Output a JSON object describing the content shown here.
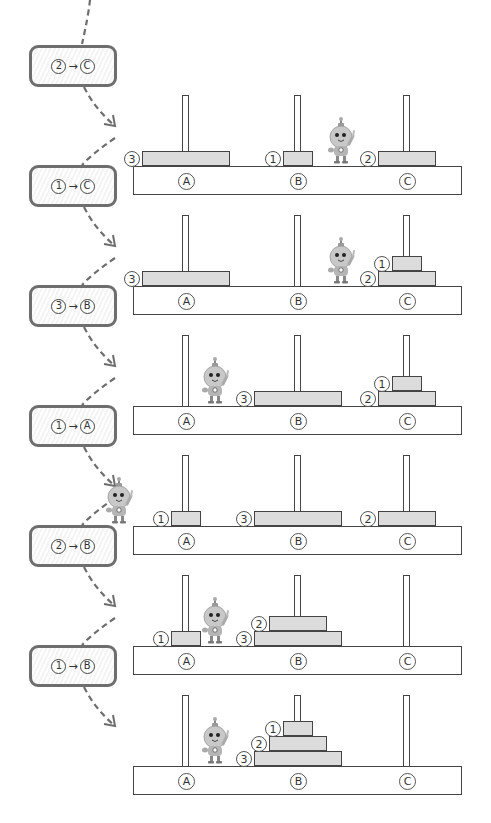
{
  "colors": {
    "outline": "#444444",
    "disk_fill": "#dcdcdc",
    "move_box_border": "#6e6e6e",
    "connector": "#6e6e6e",
    "robot_body": "#bdbdbd"
  },
  "peg_names": [
    "A",
    "B",
    "C"
  ],
  "moves": [
    {
      "disk": "2",
      "arrow": "→",
      "to": "C"
    },
    {
      "disk": "1",
      "arrow": "→",
      "to": "C"
    },
    {
      "disk": "3",
      "arrow": "→",
      "to": "B"
    },
    {
      "disk": "1",
      "arrow": "→",
      "to": "A"
    },
    {
      "disk": "2",
      "arrow": "→",
      "to": "B"
    },
    {
      "disk": "1",
      "arrow": "→",
      "to": "B"
    }
  ],
  "boards": [
    {
      "pegs": {
        "A": [
          "3"
        ],
        "B": [
          "1"
        ],
        "C": [
          "2"
        ]
      }
    },
    {
      "pegs": {
        "A": [
          "3"
        ],
        "B": [],
        "C": [
          "2",
          "1"
        ]
      }
    },
    {
      "pegs": {
        "A": [],
        "B": [
          "3"
        ],
        "C": [
          "2",
          "1"
        ]
      }
    },
    {
      "pegs": {
        "A": [
          "1"
        ],
        "B": [
          "3"
        ],
        "C": [
          "2"
        ]
      }
    },
    {
      "pegs": {
        "A": [
          "1"
        ],
        "B": [
          "3",
          "2"
        ],
        "C": []
      }
    },
    {
      "pegs": {
        "A": [],
        "B": [
          "3",
          "2",
          "1"
        ],
        "C": []
      }
    }
  ],
  "disk_labels": {
    "1": "1",
    "2": "2",
    "3": "3"
  },
  "icons": {
    "robot": "robot-mascot-icon",
    "arrow": "dashed-curved-arrow-icon"
  }
}
